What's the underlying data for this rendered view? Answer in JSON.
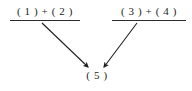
{
  "figure": {
    "kind": "derivation-diagram",
    "background_color": "#ffffff",
    "ink_color": "#231f20",
    "width": 192,
    "height": 91
  },
  "premises": [
    {
      "id": "left",
      "label": "( 1 )  +  ( 2 )",
      "has_rule_line": true,
      "rule_color": "#2c2a2b"
    },
    {
      "id": "right",
      "label": "( 3 )  +  ( 4 )",
      "has_rule_line": true,
      "rule_color": "#2c2a2b"
    }
  ],
  "conclusion": {
    "id": "five",
    "label": "( 5 )"
  },
  "arrows": [
    {
      "id": "left-to-conclusion",
      "from": "left",
      "to": "five",
      "x1": 42,
      "y1": 23,
      "x2": 88,
      "y2": 67,
      "color": "#231f20",
      "head": "filled-triangle"
    },
    {
      "id": "right-to-conclusion",
      "from": "right",
      "to": "five",
      "x1": 137,
      "y1": 23,
      "x2": 104,
      "y2": 67,
      "color": "#231f20",
      "head": "filled-triangle"
    }
  ]
}
